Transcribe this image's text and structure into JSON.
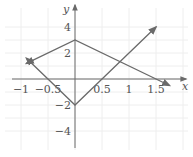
{
  "chart_data": {
    "type": "line",
    "title": "",
    "xlabel": "x",
    "ylabel": "y",
    "xlim": [
      -1,
      1.75
    ],
    "ylim": [
      -5,
      4.5
    ],
    "grid": true,
    "x_ticks": [
      -1,
      -0.5,
      0.5,
      1,
      1.5
    ],
    "x_tick_labels": [
      "−1",
      "−0.5",
      "0.5",
      "1",
      "1.5"
    ],
    "y_ticks": [
      4,
      2,
      -2,
      -4
    ],
    "y_tick_labels": [
      "4",
      "2",
      "−2",
      "−4"
    ],
    "series": [
      {
        "name": "y = 3 - 2|x|",
        "x": [
          -0.9,
          0,
          1.5,
          1.75
        ],
        "y": [
          1.2,
          3,
          0,
          -0.5
        ],
        "arrows": "both"
      },
      {
        "name": "y = 4|x| - 2",
        "x": [
          -0.9,
          0,
          0.5,
          1.5
        ],
        "y": [
          1.6,
          -2,
          0,
          4
        ],
        "arrows": "both"
      }
    ],
    "line_color": "#6a6a6a",
    "grid_color": "#eeeeee"
  }
}
